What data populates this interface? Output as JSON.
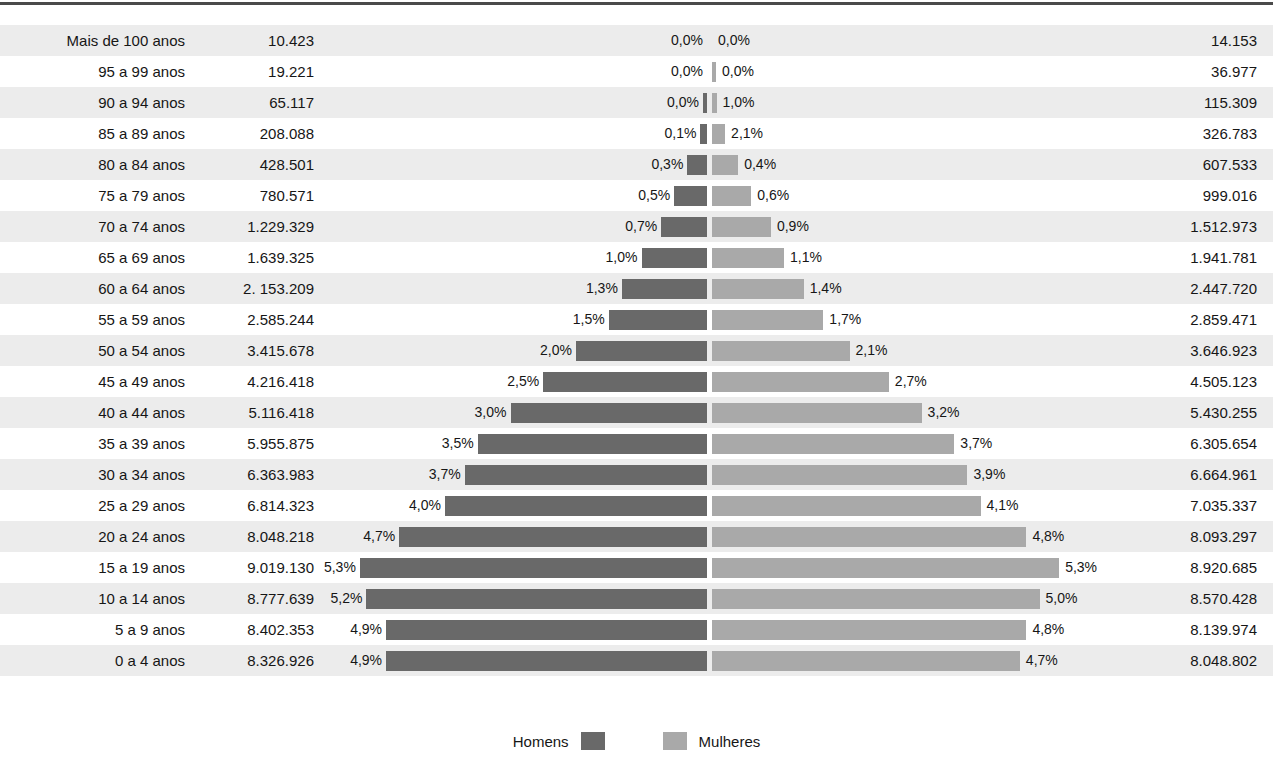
{
  "chart_data": {
    "type": "bar",
    "subtype": "population-pyramid",
    "title": "",
    "xlabel": "",
    "ylabel": "",
    "grid": false,
    "legend_position": "bottom",
    "axis_center_percent": 0,
    "xlim": [
      -6,
      6
    ],
    "categories": [
      "Mais de 100 anos",
      "95 a 99 anos",
      "90 a 94 anos",
      "85 a 89 anos",
      "80 a 84 anos",
      "75 a 79 anos",
      "70 a 74 anos",
      "65 a 69 anos",
      "60 a 64 anos",
      "55 a 59 anos",
      "50 a 54 anos",
      "45 a 49 anos",
      "40 a 44 anos",
      "35 a 39 anos",
      "30 a 34 anos",
      "25 a 29 anos",
      "20 a 24 anos",
      "15 a 19 anos",
      "10 a 14 anos",
      "5 a 9 anos",
      "0 a 4 anos"
    ],
    "series": [
      {
        "name": "Homens",
        "color": "#696969",
        "counts": [
          "10.423",
          "19.221",
          "65.117",
          "208.088",
          "428.501",
          "780.571",
          "1.229.329",
          "1.639.325",
          "2. 153.209",
          "2.585.244",
          "3.415.678",
          "4.216.418",
          "5.116.418",
          "5.955.875",
          "6.363.983",
          "6.814.323",
          "8.048.218",
          "9.019.130",
          "8.777.639",
          "8.402.353",
          "8.326.926"
        ],
        "percent_labels": [
          "0,0%",
          "0,0%",
          "0,0%",
          "0,1%",
          "0,3%",
          "0,5%",
          "0,7%",
          "1,0%",
          "1,3%",
          "1,5%",
          "2,0%",
          "2,5%",
          "3,0%",
          "3,5%",
          "3,7%",
          "4,0%",
          "4,7%",
          "5,3%",
          "5,2%",
          "4,9%",
          "4,9%"
        ],
        "values": [
          0.0,
          0.0,
          0.04,
          0.1,
          0.3,
          0.5,
          0.7,
          1.0,
          1.3,
          1.5,
          2.0,
          2.5,
          3.0,
          3.5,
          3.7,
          4.0,
          4.7,
          5.3,
          5.2,
          4.9,
          4.9
        ]
      },
      {
        "name": "Mulheres",
        "color": "#a9a9a9",
        "counts": [
          "14.153",
          "36.977",
          "115.309",
          "326.783",
          "607.533",
          "999.016",
          "1.512.973",
          "1.941.781",
          "2.447.720",
          "2.859.471",
          "3.646.923",
          "4.505.123",
          "5.430.255",
          "6.305.654",
          "6.664.961",
          "7.035.337",
          "8.093.297",
          "8.920.685",
          "8.570.428",
          "8.139.974",
          "8.048.802"
        ],
        "percent_labels": [
          "0,0%",
          "0,0%",
          "1,0%",
          "2,1%",
          "0,4%",
          "0,6%",
          "0,9%",
          "1,1%",
          "1,4%",
          "1,7%",
          "2,1%",
          "2,7%",
          "3,2%",
          "3,7%",
          "3,9%",
          "4,1%",
          "4,8%",
          "5,3%",
          "5,0%",
          "4,8%",
          "4,7%"
        ],
        "values": [
          0.0,
          0.02,
          0.07,
          0.2,
          0.4,
          0.6,
          0.9,
          1.1,
          1.4,
          1.7,
          2.1,
          2.7,
          3.2,
          3.7,
          3.9,
          4.1,
          4.8,
          5.3,
          5.0,
          4.8,
          4.7
        ]
      }
    ],
    "legend": [
      {
        "label": "Homens",
        "color": "#696969"
      },
      {
        "label": "Mulheres",
        "color": "#a9a9a9"
      }
    ]
  },
  "legend": {
    "male_label": "Homens",
    "female_label": "Mulheres"
  }
}
